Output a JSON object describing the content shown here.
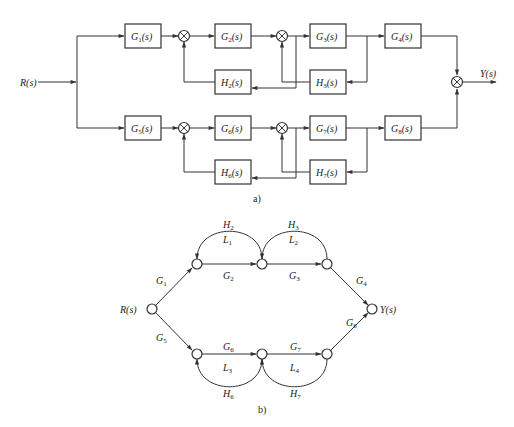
{
  "figure_a": {
    "caption": "a)",
    "input_label": "R(s)",
    "output_label": "Y(s)",
    "top_row": {
      "forward_blocks": [
        {
          "id": "G1",
          "name": "G",
          "sub": "1",
          "label": "G1(s)"
        },
        {
          "id": "G2",
          "name": "G",
          "sub": "2",
          "label": "G2(s)"
        },
        {
          "id": "G3",
          "name": "G",
          "sub": "3",
          "label": "G3(s)"
        },
        {
          "id": "G4",
          "name": "G",
          "sub": "4",
          "label": "G4(s)"
        }
      ],
      "feedback_blocks": [
        {
          "id": "H2",
          "name": "H",
          "sub": "2",
          "label": "H2(s)"
        },
        {
          "id": "H3",
          "name": "H",
          "sub": "3",
          "label": "H3(s)"
        }
      ]
    },
    "bottom_row": {
      "forward_blocks": [
        {
          "id": "G5",
          "name": "G",
          "sub": "5",
          "label": "G5(s)"
        },
        {
          "id": "G6",
          "name": "G",
          "sub": "6",
          "label": "G6(s)"
        },
        {
          "id": "G7",
          "name": "G",
          "sub": "7",
          "label": "G7(s)"
        },
        {
          "id": "G8",
          "name": "G",
          "sub": "8",
          "label": "G8(s)"
        }
      ],
      "feedback_blocks": [
        {
          "id": "H6",
          "name": "H",
          "sub": "6",
          "label": "H6(s)"
        },
        {
          "id": "H7",
          "name": "H",
          "sub": "7",
          "label": "H7(s)"
        }
      ]
    },
    "summing_junction_symbol": "⊗",
    "s_suffix": "(s)"
  },
  "figure_b": {
    "caption": "b)",
    "input_node_label": "R(s)",
    "output_node_label": "Y(s)",
    "branch_gains": {
      "G1": {
        "name": "G",
        "sub": "1"
      },
      "G2": {
        "name": "G",
        "sub": "2"
      },
      "G3": {
        "name": "G",
        "sub": "3"
      },
      "G4": {
        "name": "G",
        "sub": "4"
      },
      "G5": {
        "name": "G",
        "sub": "5"
      },
      "G6": {
        "name": "G",
        "sub": "6"
      },
      "G7": {
        "name": "G",
        "sub": "7"
      },
      "G8": {
        "name": "G",
        "sub": "8"
      },
      "H2": {
        "name": "H",
        "sub": "2"
      },
      "H3": {
        "name": "H",
        "sub": "3"
      },
      "H6": {
        "name": "H",
        "sub": "6"
      },
      "H7": {
        "name": "H",
        "sub": "7"
      }
    },
    "loops": {
      "L1": {
        "name": "L",
        "sub": "1"
      },
      "L2": {
        "name": "L",
        "sub": "2"
      },
      "L3": {
        "name": "L",
        "sub": "3"
      },
      "L4": {
        "name": "L",
        "sub": "4"
      }
    }
  },
  "colors": {
    "line": "#333333",
    "background": "#ffffff",
    "text": "#222222"
  }
}
